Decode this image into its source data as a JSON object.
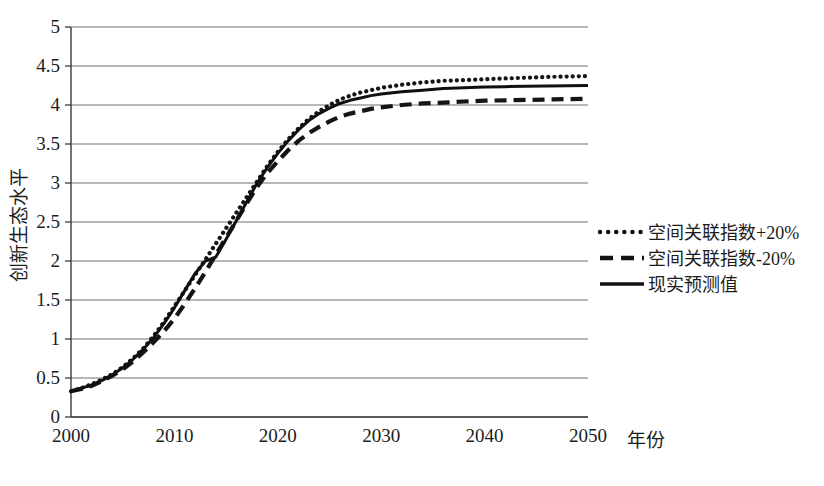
{
  "chart_data": {
    "type": "line",
    "title": "",
    "xlabel": "年份",
    "ylabel": "创新生态水平",
    "xlim": [
      2000,
      2050
    ],
    "ylim": [
      0,
      5
    ],
    "xticks": [
      2000,
      2010,
      2020,
      2030,
      2040,
      2050
    ],
    "xtick_labels": [
      "2000",
      "2010",
      "2020",
      "2030",
      "2040",
      "2050"
    ],
    "yticks": [
      0,
      0.5,
      1,
      1.5,
      2,
      2.5,
      3,
      3.5,
      4,
      4.5,
      5
    ],
    "ytick_labels": [
      "0",
      "0.5",
      "1",
      "1.5",
      "2",
      "2.5",
      "3",
      "3.5",
      "4",
      "4.5",
      "5"
    ],
    "grid": "horizontal",
    "legend_position": "right",
    "x": [
      2000,
      2001,
      2002,
      2003,
      2004,
      2005,
      2006,
      2007,
      2008,
      2009,
      2010,
      2011,
      2012,
      2013,
      2014,
      2015,
      2016,
      2017,
      2018,
      2019,
      2020,
      2021,
      2022,
      2023,
      2024,
      2025,
      2026,
      2027,
      2028,
      2029,
      2030,
      2032,
      2034,
      2036,
      2038,
      2040,
      2042,
      2044,
      2046,
      2048,
      2050
    ],
    "series": [
      {
        "name": "空间关联指数+20%",
        "style": "dotted",
        "color": "#151515",
        "values": [
          0.33,
          0.37,
          0.42,
          0.48,
          0.55,
          0.64,
          0.75,
          0.88,
          1.04,
          1.22,
          1.42,
          1.62,
          1.82,
          2.02,
          2.22,
          2.42,
          2.62,
          2.82,
          3.02,
          3.22,
          3.4,
          3.56,
          3.7,
          3.82,
          3.92,
          4.0,
          4.07,
          4.12,
          4.16,
          4.19,
          4.22,
          4.26,
          4.29,
          4.31,
          4.32,
          4.33,
          4.34,
          4.35,
          4.36,
          4.365,
          4.37
        ]
      },
      {
        "name": "空间关联指数-20%",
        "style": "dashed",
        "color": "#151515",
        "values": [
          0.33,
          0.36,
          0.4,
          0.46,
          0.53,
          0.61,
          0.71,
          0.83,
          0.96,
          1.1,
          1.26,
          1.45,
          1.65,
          1.86,
          2.08,
          2.3,
          2.52,
          2.74,
          2.95,
          3.13,
          3.28,
          3.42,
          3.54,
          3.64,
          3.72,
          3.79,
          3.85,
          3.89,
          3.92,
          3.95,
          3.97,
          4.0,
          4.02,
          4.03,
          4.045,
          4.055,
          4.06,
          4.065,
          4.07,
          4.075,
          4.08
        ]
      },
      {
        "name": "现实预测值",
        "style": "solid",
        "color": "#101010",
        "values": [
          0.33,
          0.37,
          0.41,
          0.47,
          0.54,
          0.63,
          0.74,
          0.87,
          1.02,
          1.2,
          1.4,
          1.62,
          1.84,
          2.0,
          2.05,
          2.28,
          2.52,
          2.76,
          3.0,
          3.2,
          3.38,
          3.54,
          3.68,
          3.8,
          3.89,
          3.96,
          4.02,
          4.06,
          4.09,
          4.12,
          4.14,
          4.17,
          4.19,
          4.21,
          4.22,
          4.23,
          4.235,
          4.24,
          4.245,
          4.248,
          4.25
        ]
      }
    ]
  },
  "legend": {
    "items": [
      {
        "label": "空间关联指数+20%",
        "style": "dotted"
      },
      {
        "label": "空间关联指数-20%",
        "style": "dashed"
      },
      {
        "label": "现实预测值",
        "style": "solid"
      }
    ]
  },
  "axes": {
    "x_axis_title": "年份",
    "y_axis_title": "创新生态水平"
  }
}
